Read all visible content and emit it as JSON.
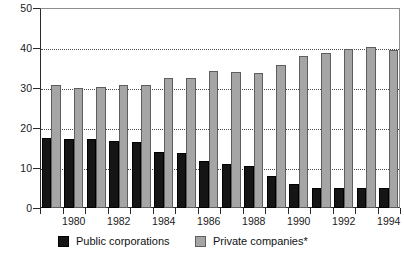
{
  "chart_data": {
    "type": "bar",
    "title": "",
    "subtitle": "",
    "xlabel": "",
    "ylabel": "",
    "ylim": [
      0,
      50
    ],
    "yticks": [
      0,
      10,
      20,
      30,
      40,
      50
    ],
    "ytick_labels": [
      "0",
      "10",
      "20",
      "30",
      "40",
      "50"
    ],
    "grid": true,
    "grid_axis": "y",
    "legend_position": "bottom",
    "categories": [
      "1979",
      "1980",
      "1981",
      "1982",
      "1983",
      "1984",
      "1985",
      "1986",
      "1987",
      "1988",
      "1989",
      "1990",
      "1991",
      "1992",
      "1993",
      "1994"
    ],
    "xtick_labels": [
      "1980",
      "1982",
      "1984",
      "1986",
      "1988",
      "1990",
      "1992",
      "1994"
    ],
    "xtick_label_categories": [
      "1980",
      "1982",
      "1984",
      "1986",
      "1988",
      "1990",
      "1992",
      "1994"
    ],
    "series": [
      {
        "name": "Public corporations",
        "color": "#151515",
        "values": [
          17.5,
          17.3,
          17.2,
          16.8,
          16.5,
          14.0,
          13.7,
          11.8,
          11.0,
          10.5,
          8.0,
          6.0,
          5.0,
          5.0,
          5.0,
          5.0
        ]
      },
      {
        "name": "Private companies*",
        "color": "#a5a5a5",
        "values": [
          30.7,
          30.0,
          30.3,
          30.8,
          30.8,
          32.5,
          32.5,
          34.2,
          34.0,
          33.8,
          35.8,
          38.0,
          38.7,
          39.7,
          40.2,
          39.5
        ]
      }
    ]
  },
  "legend": {
    "entries": [
      {
        "label": "Public corporations",
        "key": "public"
      },
      {
        "label": "Private companies*",
        "key": "private"
      }
    ]
  }
}
